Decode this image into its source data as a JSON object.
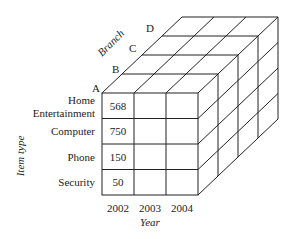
{
  "diagram": {
    "type": "data-cube",
    "axes": {
      "x": {
        "label": "Year",
        "values": [
          "2002",
          "2003",
          "2004"
        ]
      },
      "y": {
        "label": "Item type",
        "values": [
          "Home Entertainment",
          "Computer",
          "Phone",
          "Security"
        ]
      },
      "z": {
        "label": "Branch",
        "values": [
          "A",
          "B",
          "C",
          "D"
        ]
      }
    },
    "row_labels": [
      {
        "line1": "Home",
        "line2": "Entertainment"
      },
      {
        "line1": "Computer"
      },
      {
        "line1": "Phone"
      },
      {
        "line1": "Security"
      }
    ],
    "cells": {
      "branch_A_2002": [
        "568",
        "750",
        "150",
        "50"
      ]
    },
    "colors": {
      "line": "#222222",
      "background": "#ffffff"
    }
  }
}
